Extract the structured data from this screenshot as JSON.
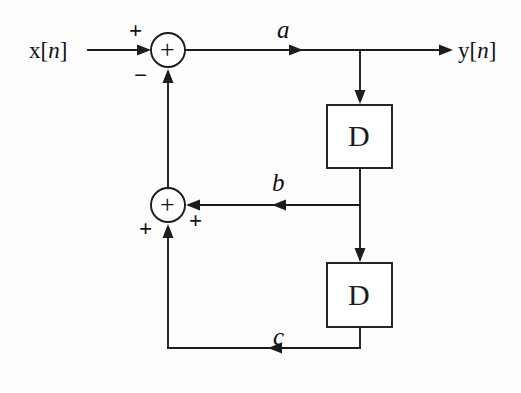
{
  "diagram": {
    "type": "signal-flow-block-diagram",
    "stroke_color": "#1c1c1c",
    "background_color": "#fdfdfd",
    "input": {
      "label_prefix": "x[",
      "label_index": "n",
      "label_suffix": "]"
    },
    "output": {
      "label_prefix": "y[",
      "label_index": "n",
      "label_suffix": "]"
    },
    "signals": {
      "a": "a",
      "b": "b",
      "c": "c"
    },
    "adders": [
      {
        "id": "adder-1",
        "operator": "+",
        "sign_input_x": "+",
        "sign_input_feedback": "−"
      },
      {
        "id": "adder-2",
        "operator": "+",
        "sign_input_b": "+",
        "sign_input_c": "+"
      }
    ],
    "delay_blocks": [
      {
        "id": "delay-1",
        "label": "D"
      },
      {
        "id": "delay-2",
        "label": "D"
      }
    ]
  }
}
